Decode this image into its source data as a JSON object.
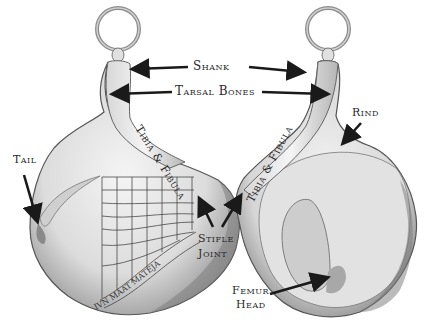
{
  "diagram": {
    "colors": {
      "background": "#ffffff",
      "ham_fill": "#ebebeb",
      "ham_shade": "#9a9a9a",
      "outline": "#555555",
      "arrow": "#1a1a1a",
      "text": "#2a2a2a"
    },
    "labels": {
      "shank": "Shank",
      "tarsal_bones": "Tarsal Bones",
      "rind": "Rind",
      "tail": "Tail",
      "stifle_line1": "Stifle",
      "stifle_line2": "Joint",
      "femur_line1": "Femur",
      "femur_line2": "Head",
      "tibia_left": "Tibia & Fibula",
      "tibia_right": "Tibia & Fibula"
    },
    "views": [
      {
        "name": "left-ham",
        "labels": [
          "Tail",
          "Tibia & Fibula",
          "Stifle Joint"
        ],
        "has_slicing_grid": true
      },
      {
        "name": "right-ham",
        "labels": [
          "Rind",
          "Tibia & Fibula",
          "Femur Head"
        ],
        "has_slicing_grid": false
      }
    ],
    "shared_labels": [
      "Shank",
      "Tarsal Bones"
    ]
  }
}
